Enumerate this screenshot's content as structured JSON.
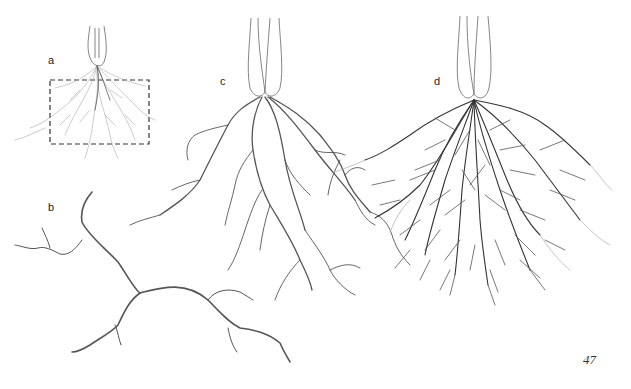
{
  "figure": {
    "panels": [
      {
        "id": "a",
        "label": "a",
        "description": "fine dense root system within dashed soil-volume box"
      },
      {
        "id": "b",
        "label": "b",
        "description": "single branching root segment"
      },
      {
        "id": "c",
        "label": "c",
        "description": "sparse branching root system below bulb"
      },
      {
        "id": "d",
        "label": "d",
        "description": "dense fibrous root system below bulb"
      }
    ],
    "colors": {
      "ink": "#333333",
      "light_ink": "#aaaaaa",
      "paper": "#ffffff"
    }
  },
  "page": {
    "number": "47"
  }
}
